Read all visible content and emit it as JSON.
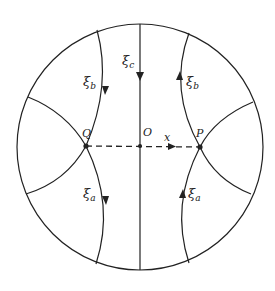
{
  "diagram": {
    "labels": {
      "xi_c": "ξ",
      "xi_c_sub": "c",
      "xi_b_left": "ξ",
      "xi_b_left_sub": "b",
      "xi_b_right": "ξ",
      "xi_b_right_sub": "b",
      "xi_a_left": "ξ",
      "xi_a_left_sub": "a",
      "xi_a_right": "ξ",
      "xi_a_right_sub": "a",
      "Q": "Q",
      "O": "O",
      "P": "P",
      "x": "x"
    },
    "colors": {
      "stroke": "#222222",
      "background": "#ffffff"
    }
  }
}
